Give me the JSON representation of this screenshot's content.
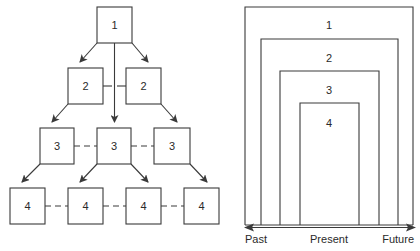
{
  "tree": {
    "level1": [
      {
        "label": "1"
      }
    ],
    "level2": [
      {
        "label": "2"
      },
      {
        "label": "2"
      }
    ],
    "level3": [
      {
        "label": "3"
      },
      {
        "label": "3"
      },
      {
        "label": "3"
      }
    ],
    "level4": [
      {
        "label": "4"
      },
      {
        "label": "4"
      },
      {
        "label": "4"
      },
      {
        "label": "4"
      }
    ]
  },
  "nested": {
    "levels": [
      {
        "label": "1"
      },
      {
        "label": "2"
      },
      {
        "label": "3"
      },
      {
        "label": "4"
      }
    ]
  },
  "timeline": {
    "past": "Past",
    "present": "Present",
    "future": "Future"
  },
  "colors": {
    "stroke": "#3a3a3a",
    "text": "#2a2a2a",
    "background": "#ffffff"
  }
}
